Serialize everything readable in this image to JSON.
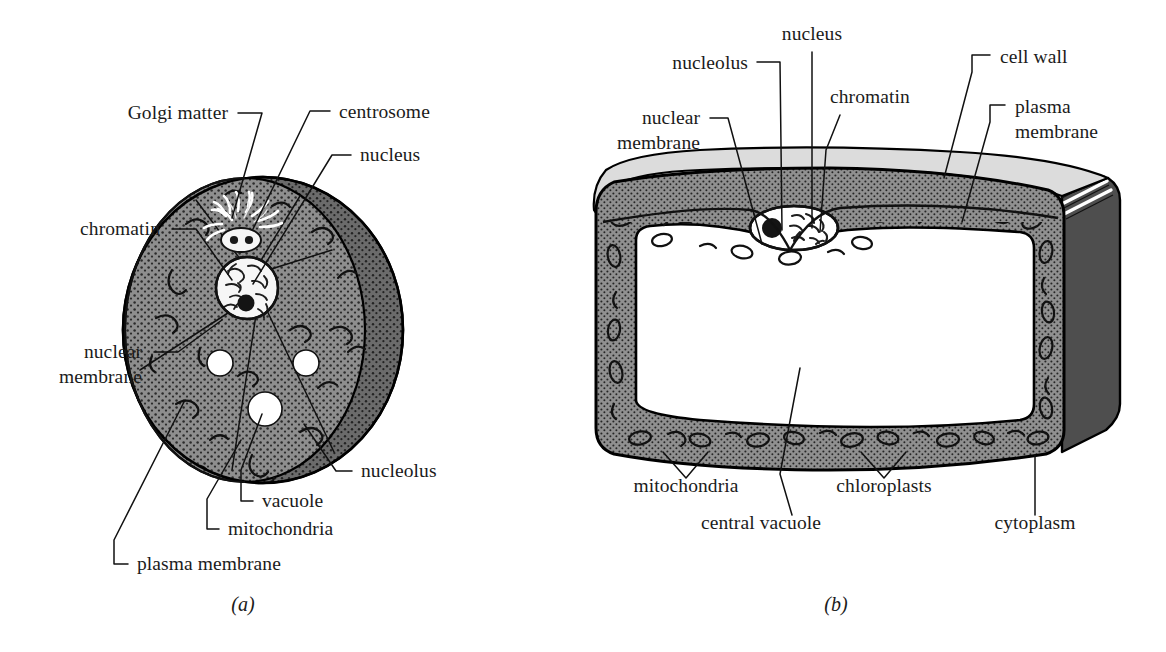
{
  "figure": {
    "captions": [
      {
        "id": "a",
        "text": "(a)",
        "subject": "animal-cell"
      },
      {
        "id": "b",
        "text": "(b)",
        "subject": "plant-cell"
      }
    ]
  },
  "colors": {
    "background": "#ffffff",
    "ink": "#111111",
    "text": "#1b1b1b",
    "cytoplasm_gray": "#8e8e8e",
    "cytoplasm_dark": "#6b6b6b",
    "cell_wall_light": "#dcdcdc",
    "side_face_dark": "#4e4e4e",
    "vacuole_white": "#ffffff",
    "nucleus_white": "#f4f4f4",
    "stipple": "#2a2a2a"
  },
  "animal_cell": {
    "name": "animal cell",
    "caption": "(a)",
    "labels": [
      {
        "key": "golgi",
        "text": "Golgi matter",
        "lines": [
          "Golgi matter"
        ],
        "align": "end",
        "x": 228,
        "y": 119
      },
      {
        "key": "centrosome",
        "text": "centrosome",
        "lines": [
          "centrosome"
        ],
        "align": "start",
        "x": 339,
        "y": 118
      },
      {
        "key": "nucleus",
        "text": "nucleus",
        "lines": [
          "nucleus"
        ],
        "align": "start",
        "x": 360,
        "y": 161
      },
      {
        "key": "chromatin",
        "text": "chromatin",
        "lines": [
          "chromatin"
        ],
        "align": "end",
        "x": 160,
        "y": 235
      },
      {
        "key": "nuclear_membrane",
        "text": "nuclear membrane",
        "lines": [
          "nuclear",
          "membrane"
        ],
        "align": "end",
        "x": 142,
        "y": 358
      },
      {
        "key": "nucleolus",
        "text": "nucleolus",
        "lines": [
          "nucleolus"
        ],
        "align": "start",
        "x": 361,
        "y": 477
      },
      {
        "key": "vacuole",
        "text": "vacuole",
        "lines": [
          "vacuole"
        ],
        "align": "start",
        "x": 262,
        "y": 507
      },
      {
        "key": "mitochondria",
        "text": "mitochondria",
        "lines": [
          "mitochondria"
        ],
        "align": "start",
        "x": 228,
        "y": 535
      },
      {
        "key": "plasma_membrane",
        "text": "plasma membrane",
        "lines": [
          "plasma membrane"
        ],
        "align": "start",
        "x": 137,
        "y": 570
      }
    ],
    "parts": [
      "cytoplasm",
      "Golgi matter",
      "centrosome",
      "nucleus",
      "chromatin",
      "nuclear membrane",
      "nucleolus",
      "vacuole",
      "mitochondria",
      "plasma membrane"
    ]
  },
  "plant_cell": {
    "name": "plant cell",
    "caption": "(b)",
    "labels": [
      {
        "key": "nucleus",
        "text": "nucleus",
        "lines": [
          "nucleus"
        ],
        "align": "middle",
        "x": 812,
        "y": 40
      },
      {
        "key": "nucleolus",
        "text": "nucleolus",
        "lines": [
          "nucleolus"
        ],
        "align": "end",
        "x": 748,
        "y": 69
      },
      {
        "key": "chromatin",
        "text": "chromatin",
        "lines": [
          "chromatin"
        ],
        "align": "start",
        "x": 830,
        "y": 103
      },
      {
        "key": "cell_wall",
        "text": "cell wall",
        "lines": [
          "cell wall"
        ],
        "align": "start",
        "x": 1000,
        "y": 63
      },
      {
        "key": "plasma_membrane",
        "text": "plasma membrane",
        "lines": [
          "plasma",
          "membrane"
        ],
        "align": "start",
        "x": 1015,
        "y": 113
      },
      {
        "key": "nuclear_membrane",
        "text": "nuclear membrane",
        "lines": [
          "nuclear",
          "membrane"
        ],
        "align": "end",
        "x": 700,
        "y": 124
      },
      {
        "key": "mitochondria",
        "text": "mitochondria",
        "lines": [
          "mitochondria"
        ],
        "align": "middle",
        "x": 686,
        "y": 492
      },
      {
        "key": "chloroplasts",
        "text": "chloroplasts",
        "lines": [
          "chloroplasts"
        ],
        "align": "middle",
        "x": 884,
        "y": 492
      },
      {
        "key": "central_vacuole",
        "text": "central vacuole",
        "lines": [
          "central vacuole"
        ],
        "align": "middle",
        "x": 761,
        "y": 529
      },
      {
        "key": "cytoplasm",
        "text": "cytoplasm",
        "lines": [
          "cytoplasm"
        ],
        "align": "middle",
        "x": 1035,
        "y": 529
      }
    ],
    "parts": [
      "cell wall",
      "plasma membrane",
      "cytoplasm",
      "central vacuole",
      "nucleus",
      "nucleolus",
      "chromatin",
      "nuclear membrane",
      "mitochondria",
      "chloroplasts"
    ]
  }
}
